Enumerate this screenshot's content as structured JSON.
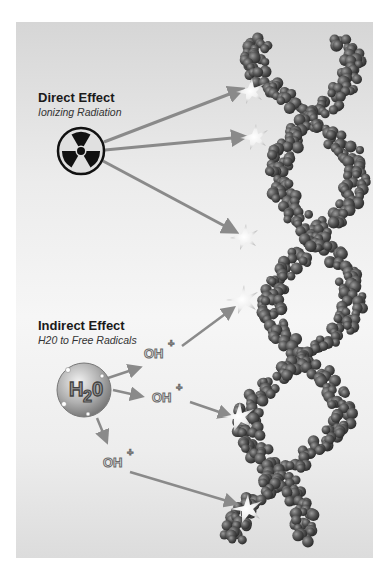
{
  "direct": {
    "title": "Direct Effect",
    "subtitle": "Ionizing Radiation",
    "source_icon": "radiation-trefoil-icon"
  },
  "indirect": {
    "title": "Indirect Effect",
    "subtitle": "H20 to Free Radicals",
    "source_label": "H20",
    "radicals": [
      {
        "label": "OH",
        "charge": "+"
      },
      {
        "label": "OH",
        "charge": "+"
      },
      {
        "label": "OH",
        "charge": "+"
      }
    ]
  },
  "target": "dna-double-helix",
  "colors": {
    "panel_top": "#d6d6d6",
    "arrow": "#8a8a8a",
    "bead": "#5a5a5a",
    "text": "#1a1a1a"
  }
}
